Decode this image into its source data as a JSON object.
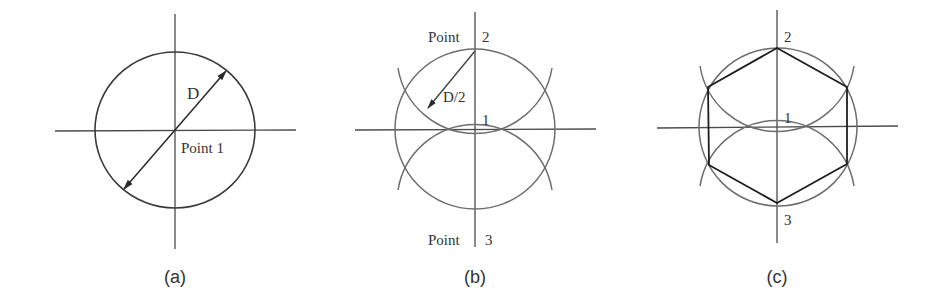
{
  "figure": {
    "panels": [
      {
        "id": "a",
        "caption": "(a)",
        "labels": {
          "diameter": "D",
          "center": "Point 1"
        },
        "description": "Circle of diameter D drawn around center Point 1 with crossing center lines"
      },
      {
        "id": "b",
        "caption": "(b)",
        "labels": {
          "top_prefix": "Point",
          "top_num": "2",
          "radius": "D/2",
          "center": "1",
          "bottom_prefix": "Point",
          "bottom_num": "3"
        },
        "description": "Arcs of radius D/2 swung from Point 2 and Point 3 intersecting the circle"
      },
      {
        "id": "c",
        "caption": "(c)",
        "labels": {
          "top": "2",
          "center": "1",
          "bottom": "3"
        },
        "description": "Regular hexagon inscribed in the circle by joining the arc intersection points"
      }
    ],
    "colors": {
      "background": "#ffffff",
      "construction": "#6e6e6e",
      "outline": "#1e1e1e",
      "text": "#333333"
    }
  }
}
